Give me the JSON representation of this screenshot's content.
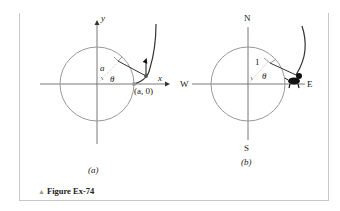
{
  "figure": {
    "caption": "Figure Ex-74",
    "caption_marker": "▲",
    "colors": {
      "circle": "#999999",
      "axis": "#555555",
      "curve": "#333333",
      "frame": "#c8c8c8"
    }
  },
  "panel_a": {
    "label": "(a)",
    "x_axis_label": "x",
    "y_axis_label": "y",
    "radius_label": "a",
    "angle_label": "θ",
    "point_label": "(a, 0)"
  },
  "panel_b": {
    "label": "(b)",
    "north": "N",
    "south": "S",
    "east": "E",
    "west": "W",
    "radius_label": "1",
    "angle_label": "θ",
    "icon": "dog-icon"
  }
}
